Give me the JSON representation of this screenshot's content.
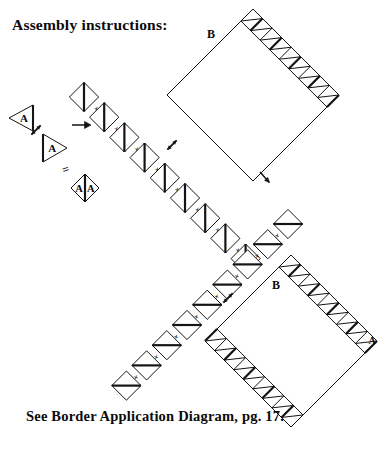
{
  "page": {
    "title": "Assembly instructions:",
    "footer": "See Border Application Diagram, pg. 17.",
    "width": 392,
    "height": 451,
    "background": "#ffffff",
    "ink": "#111111"
  },
  "labels": {
    "piece_a": "A",
    "piece_b": "B",
    "plus": "+",
    "equals": "="
  },
  "legend_row": {
    "triangle_left": {
      "label": "A",
      "orientation": "points-left",
      "x": 9,
      "y": 105
    },
    "rotate_icon": {
      "name": "rotate-arrow-icon",
      "x": 30,
      "y": 124
    },
    "triangle_right": {
      "label": "A",
      "orientation": "points-right",
      "x": 43,
      "y": 134
    },
    "arrow_right": {
      "name": "arrow-right-icon",
      "x": 72,
      "y": 125
    },
    "equals_sign": {
      "label": "=",
      "x": 64,
      "y": 168
    },
    "unit_square": {
      "labels": [
        "A",
        "A"
      ],
      "x": 71,
      "y": 188
    }
  },
  "chain": {
    "description": "Diagonal chain of pieced square units joined by plus signs",
    "segment_one": {
      "divider": "vertical",
      "count": 9,
      "start": {
        "x": 84,
        "y": 97
      },
      "step": {
        "x": 20.2,
        "y": 20.2
      }
    },
    "segment_two": {
      "divider": "horizontal",
      "count": 9,
      "start": {
        "x": 288,
        "y": 224
      },
      "step": {
        "x": -20.2,
        "y": 20.2
      }
    }
  },
  "blocks": [
    {
      "name": "block-b-top",
      "label": "B",
      "label_x": 211,
      "label_y": 38,
      "center": {
        "x": 253,
        "y": 95
      },
      "half": 86,
      "borders": [
        "upper-right"
      ],
      "teeth": 9
    },
    {
      "name": "block-b-bottom",
      "label": "B",
      "label_x": 276,
      "label_y": 289,
      "corner_label": "A",
      "corner_label_x": 372,
      "corner_label_y": 344,
      "center": {
        "x": 291,
        "y": 341
      },
      "half": 86,
      "borders": [
        "upper-right",
        "lower-left"
      ],
      "teeth": 9
    }
  ],
  "arrows": [
    {
      "name": "rotate-arrow-icon",
      "x": 172,
      "y": 145,
      "dir": "ne-sw"
    },
    {
      "name": "arrow-down-right-icon",
      "x": 260,
      "y": 172
    },
    {
      "name": "rotate-arrow-icon",
      "x": 228,
      "y": 298,
      "dir": "nw-se"
    }
  ],
  "colors": {
    "stroke": "#141414",
    "fill": "#ffffff"
  }
}
